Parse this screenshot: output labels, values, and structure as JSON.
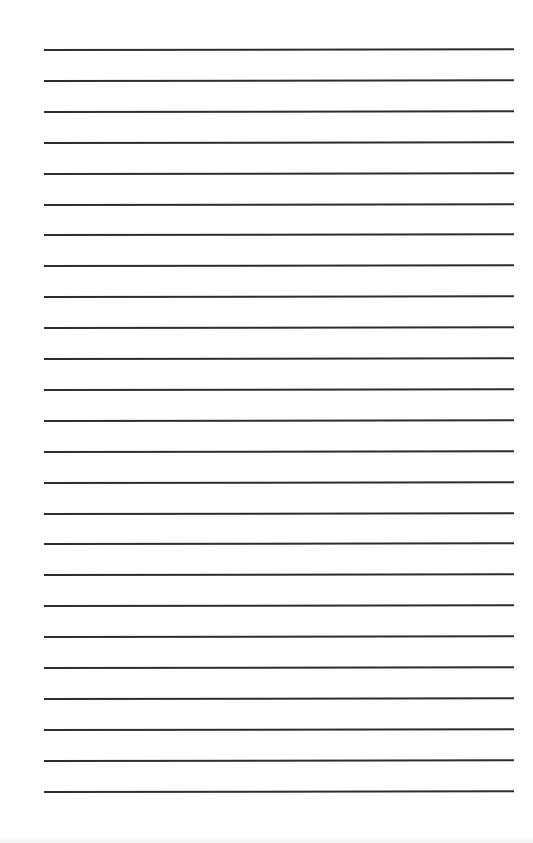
{
  "document": {
    "type": "lined-paper",
    "background_color": "#ffffff",
    "line_color": "#2e2e2e",
    "line_count": 25,
    "first_line_y": 49,
    "line_spacing": 30.9,
    "line_left": 44,
    "line_right": 514,
    "lines": [
      {
        "index": 1,
        "text": ""
      },
      {
        "index": 2,
        "text": ""
      },
      {
        "index": 3,
        "text": ""
      },
      {
        "index": 4,
        "text": ""
      },
      {
        "index": 5,
        "text": ""
      },
      {
        "index": 6,
        "text": ""
      },
      {
        "index": 7,
        "text": ""
      },
      {
        "index": 8,
        "text": ""
      },
      {
        "index": 9,
        "text": ""
      },
      {
        "index": 10,
        "text": ""
      },
      {
        "index": 11,
        "text": ""
      },
      {
        "index": 12,
        "text": ""
      },
      {
        "index": 13,
        "text": ""
      },
      {
        "index": 14,
        "text": ""
      },
      {
        "index": 15,
        "text": ""
      },
      {
        "index": 16,
        "text": ""
      },
      {
        "index": 17,
        "text": ""
      },
      {
        "index": 18,
        "text": ""
      },
      {
        "index": 19,
        "text": ""
      },
      {
        "index": 20,
        "text": ""
      },
      {
        "index": 21,
        "text": ""
      },
      {
        "index": 22,
        "text": ""
      },
      {
        "index": 23,
        "text": ""
      },
      {
        "index": 24,
        "text": ""
      },
      {
        "index": 25,
        "text": ""
      }
    ]
  }
}
